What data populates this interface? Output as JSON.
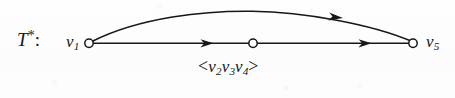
{
  "figure": {
    "name": "directed-multigraph-t-star",
    "background_color": "#fdfdfd",
    "ink_color": "#15171a",
    "node_fill_color": "#ffffff",
    "labels": {
      "graph_name": "T",
      "graph_name_superscript": "*",
      "graph_name_colon": ":",
      "left_vertex": "v",
      "left_vertex_sub": "1",
      "right_vertex": "v",
      "right_vertex_sub": "5",
      "path_open_bracket": "<",
      "path_v2": "v",
      "path_v2_sub": "2",
      "path_v3": "v",
      "path_v3_sub": "3",
      "path_v4": "v",
      "path_v4_sub": "4",
      "path_close_bracket": ">"
    },
    "nodes": [
      {
        "id": "v1",
        "label": "v1",
        "cx": 89,
        "cy": 43,
        "r": 4.2,
        "style": "open-circle"
      },
      {
        "id": "v_mid",
        "label": "",
        "cx": 253,
        "cy": 43,
        "r": 4.2,
        "style": "open-circle"
      },
      {
        "id": "v5",
        "label": "v5",
        "cx": 413,
        "cy": 43,
        "r": 4.2,
        "style": "open-circle"
      }
    ],
    "edges": [
      {
        "id": "straight-edge-left",
        "from": "v1",
        "to": "v_mid",
        "shape": "straight",
        "arrowhead_at": {
          "x": 212,
          "y": 43
        },
        "direction": "left-to-right"
      },
      {
        "id": "straight-edge-right",
        "from": "v_mid",
        "to": "v5",
        "shape": "straight",
        "arrowhead_at": {
          "x": 370,
          "y": 43
        },
        "direction": "left-to-right"
      },
      {
        "id": "curved-edge",
        "from": "v1",
        "to": "v5",
        "shape": "arc",
        "apex": {
          "x": 251,
          "y": 11
        },
        "arrowhead_at": {
          "x": 341,
          "y": 17
        },
        "direction": "left-to-right"
      }
    ]
  }
}
